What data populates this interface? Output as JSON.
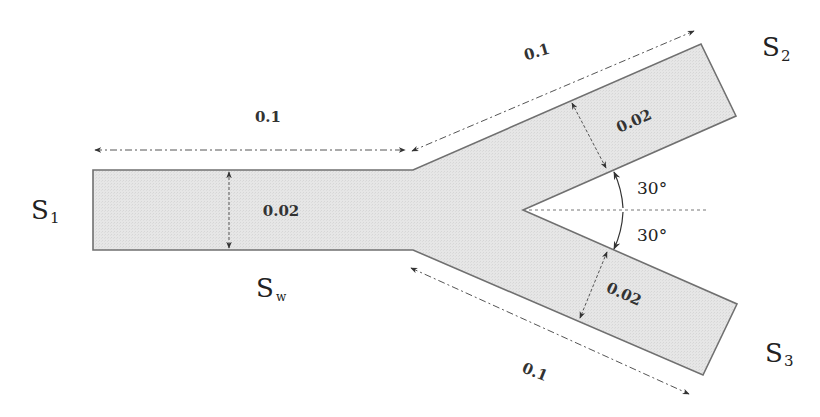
{
  "diagram": {
    "colors": {
      "fill": "#e4e4e4",
      "outline": "#707070",
      "dimension_line": "#555555",
      "text": "#222222"
    },
    "boundaries": {
      "inlet": {
        "symbol": "S",
        "subscript": "1"
      },
      "wall": {
        "symbol": "S",
        "subscript": "w"
      },
      "outlet_upper": {
        "symbol": "S",
        "subscript": "2"
      },
      "outlet_lower": {
        "symbol": "S",
        "subscript": "3"
      }
    },
    "dimensions": {
      "inlet_length": "0.1",
      "inlet_width": "0.02",
      "upper_branch_length": "0.1",
      "upper_branch_width": "0.02",
      "lower_branch_length": "0.1",
      "lower_branch_width": "0.02"
    },
    "angles": {
      "upper": "30°",
      "lower": "30°"
    }
  }
}
